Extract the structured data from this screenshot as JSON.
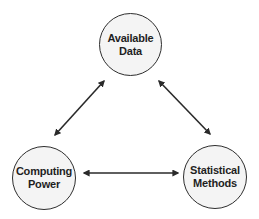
{
  "diagram": {
    "type": "triangle-relationship",
    "colors": {
      "node_fill": "#f4f4f4",
      "node_stroke": "#2e2e2e",
      "text": "#1f1f1f",
      "arrow": "#2a2a2a",
      "background": "#ffffff"
    },
    "nodes": [
      {
        "id": "available-data",
        "line1": "Available",
        "line2": "Data"
      },
      {
        "id": "computing-power",
        "line1": "Computing",
        "line2": "Power"
      },
      {
        "id": "statistical-methods",
        "line1": "Statistical",
        "line2": "Methods"
      }
    ],
    "edges": [
      {
        "from": "available-data",
        "to": "computing-power",
        "direction": "bidirectional"
      },
      {
        "from": "available-data",
        "to": "statistical-methods",
        "direction": "bidirectional"
      },
      {
        "from": "computing-power",
        "to": "statistical-methods",
        "direction": "bidirectional"
      }
    ]
  }
}
